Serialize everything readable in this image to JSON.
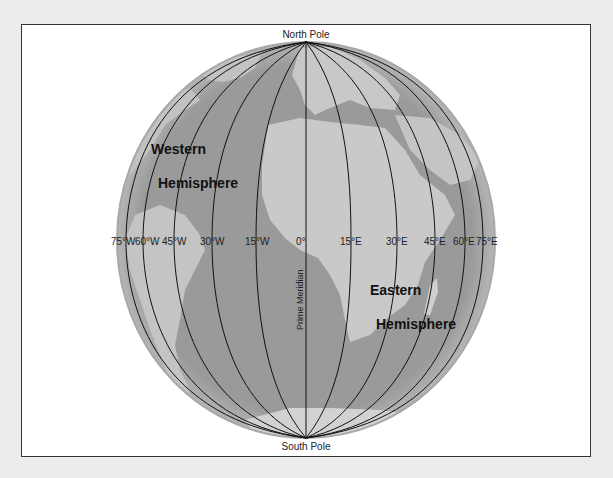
{
  "figure": {
    "poles": {
      "north": "North Pole",
      "south": "South Pole"
    },
    "prime_meridian_label": "Prime Meridian",
    "hemispheres": {
      "western": [
        "Western",
        "Hemisphere"
      ],
      "eastern": [
        "Eastern",
        "Hemisphere"
      ]
    },
    "meridians": [
      {
        "label": "75°W",
        "x": 126
      },
      {
        "label": "60°W",
        "x": 143
      },
      {
        "label": "45°W",
        "x": 174
      },
      {
        "label": "30°W",
        "x": 212
      },
      {
        "label": "15°W",
        "x": 256
      },
      {
        "label": "0°",
        "x": 306
      },
      {
        "label": "15°E",
        "x": 351
      },
      {
        "label": "30°E",
        "x": 397
      },
      {
        "label": "45°E",
        "x": 435
      },
      {
        "label": "60°E",
        "x": 465
      },
      {
        "label": "75°E",
        "x": 483
      }
    ],
    "colors": {
      "ocean": "#9a9a9a",
      "land": "#c8c8c8",
      "rim": "#b0b0b0",
      "line": "#111111"
    }
  }
}
